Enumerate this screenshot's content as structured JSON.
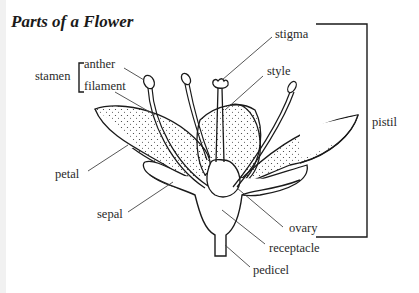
{
  "title": "Parts of a Flower",
  "labels": {
    "stamen": "stamen",
    "anther": "anther",
    "filament": "filament",
    "stigma": "stigma",
    "style": "style",
    "pistil": "pistil",
    "petal": "petal",
    "sepal": "sepal",
    "ovary": "ovary",
    "receptacle": "receptacle",
    "pedicel": "pedicel"
  },
  "groups": {
    "stamen": [
      "anther",
      "filament"
    ],
    "pistil": [
      "stigma",
      "style",
      "ovary"
    ]
  },
  "colors": {
    "line": "#1a1a1a",
    "leader": "#444444",
    "text": "#2a2a2a"
  }
}
